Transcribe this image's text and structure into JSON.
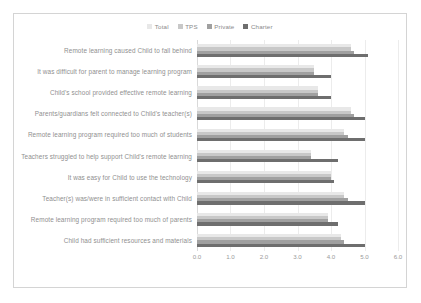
{
  "chart_data": {
    "type": "bar",
    "orientation": "horizontal",
    "title": "",
    "xlabel": "",
    "ylabel": "",
    "xlim": [
      0.0,
      6.0
    ],
    "xticks": [
      "0.0",
      "1.0",
      "2.0",
      "3.0",
      "4.0",
      "5.0",
      "6.0"
    ],
    "xtick_values": [
      0.0,
      1.0,
      2.0,
      3.0,
      4.0,
      5.0,
      6.0
    ],
    "grid": true,
    "legend_position": "top-center",
    "categories": [
      "Remote learning caused Child to fall behind",
      "It was difficult for parent to manage learning program",
      "Child's school provided effective remote learning",
      "Parents/guardians felt connected to Child's teacher(s)",
      "Remote learning program required too much of students",
      "Teachers struggled to help support Child's remote learning",
      "It was easy for Child to use the technology",
      "Teacher(s) was/were in sufficient contact with Child",
      "Remote learning program required too much of parents",
      "Child had sufficient resources and materials"
    ],
    "series": [
      {
        "name": "Total",
        "color": "#e8e8e8",
        "values": [
          4.6,
          3.5,
          3.6,
          4.6,
          4.4,
          3.4,
          4.0,
          4.4,
          3.9,
          4.3
        ]
      },
      {
        "name": "TPS",
        "color": "#c8c8c8",
        "values": [
          4.6,
          3.5,
          3.6,
          4.6,
          4.4,
          3.4,
          4.0,
          4.4,
          3.9,
          4.3
        ]
      },
      {
        "name": "Private",
        "color": "#a0a0a0",
        "values": [
          4.7,
          3.5,
          3.6,
          4.7,
          4.5,
          3.4,
          4.0,
          4.5,
          3.9,
          4.4
        ]
      },
      {
        "name": "Charter",
        "color": "#6e6e6e",
        "values": [
          5.1,
          4.0,
          4.0,
          5.0,
          5.0,
          4.2,
          4.1,
          5.0,
          4.2,
          5.0
        ]
      }
    ]
  }
}
